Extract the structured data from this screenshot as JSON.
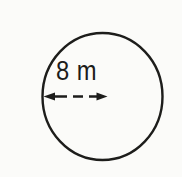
{
  "figure": {
    "label": "8 m",
    "shape": "circle",
    "measurement": {
      "value": "8",
      "unit": "m",
      "depicts": "radius"
    },
    "colors": {
      "ink": "#1d1d1b",
      "paper": "#fbfbf9"
    }
  }
}
